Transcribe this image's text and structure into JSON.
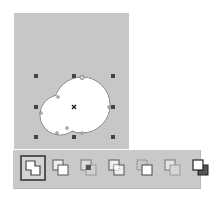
{
  "canvas": {
    "background": "#c7c7c7",
    "shape": {
      "type": "welded-circles",
      "fill": "#ffffff",
      "stroke": "#888888",
      "large_circle": {
        "cx": 82,
        "cy": 105,
        "r": 28
      },
      "small_circle": {
        "cx": 60,
        "cy": 115,
        "r": 20
      }
    },
    "selection_handles": [
      {
        "x": 36,
        "y": 76
      },
      {
        "x": 74,
        "y": 76
      },
      {
        "x": 113,
        "y": 76
      },
      {
        "x": 36,
        "y": 107
      },
      {
        "x": 113,
        "y": 107
      },
      {
        "x": 36,
        "y": 137
      },
      {
        "x": 74,
        "y": 137
      },
      {
        "x": 113,
        "y": 137
      }
    ],
    "center_marker": {
      "x": 74,
      "y": 107,
      "icon": "x-center-icon"
    }
  },
  "toolbar": {
    "buttons": [
      {
        "name": "weld",
        "icon": "weld-icon",
        "active": true
      },
      {
        "name": "trim",
        "icon": "trim-icon",
        "active": false
      },
      {
        "name": "intersect",
        "icon": "intersect-icon",
        "active": false
      },
      {
        "name": "simplify",
        "icon": "simplify-icon",
        "active": false
      },
      {
        "name": "front-minus-back",
        "icon": "front-minus-back-icon",
        "active": false
      },
      {
        "name": "back-minus-front",
        "icon": "back-minus-front-icon",
        "active": false
      },
      {
        "name": "create-boundary",
        "icon": "create-boundary-icon",
        "active": false
      }
    ]
  }
}
